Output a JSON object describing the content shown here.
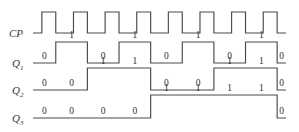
{
  "figure": {
    "kind": "timing-diagram",
    "stroke_color": "#4a4a4a",
    "text_color": "#2e2e2e",
    "background": "#ffffff"
  },
  "geometry": {
    "x_start": 33,
    "x_end": 286,
    "cycles": 8,
    "cp_baseline_y": 33,
    "cp_high_y": 12,
    "q1_baseline_y": 63,
    "q1_high_y": 42,
    "q2_baseline_y": 90,
    "q2_high_y": 68,
    "q3_baseline_y": 118,
    "q3_high_y": 95
  },
  "rows": [
    {
      "id": "cp",
      "label": "CP",
      "label_base": "CP",
      "label_sub": "",
      "label_x": 9,
      "label_y": 37,
      "show_values": false,
      "values": []
    },
    {
      "id": "q1",
      "label": "Q1",
      "label_base": "Q",
      "label_sub": "1",
      "label_x": 12,
      "label_y": 67,
      "show_values": true,
      "values": [
        "0",
        "1",
        "0",
        "1",
        "0",
        "1",
        "0",
        "1",
        "0"
      ]
    },
    {
      "id": "q2",
      "label": "Q2",
      "label_base": "Q",
      "label_sub": "2",
      "label_x": 12,
      "label_y": 94,
      "show_values": true,
      "values": [
        "0",
        "0",
        "1",
        "1",
        "0",
        "0",
        "1",
        "1",
        "0"
      ]
    },
    {
      "id": "q3",
      "label": "Q3",
      "label_base": "Q",
      "label_sub": "3",
      "label_x": 12,
      "label_y": 122,
      "show_values": true,
      "values": [
        "0",
        "0",
        "0",
        "0",
        "1",
        "1",
        "1",
        "1",
        "0"
      ]
    }
  ],
  "chart_data": {
    "type": "line",
    "title": "",
    "xlabel": "",
    "ylabel": "",
    "signals": [
      {
        "name": "CP",
        "waveform": [
          0,
          1,
          0,
          1,
          0,
          1,
          0,
          1,
          0,
          1,
          0,
          1,
          0,
          1,
          0,
          1,
          0
        ],
        "note": "clock, 8 pulses, starts low"
      },
      {
        "name": "Q1",
        "values": [
          0,
          1,
          0,
          1,
          0,
          1,
          0,
          1,
          0
        ],
        "note": "toggles on each clock falling edge"
      },
      {
        "name": "Q2",
        "values": [
          0,
          0,
          1,
          1,
          0,
          0,
          1,
          1,
          0
        ],
        "note": "toggles every two counts"
      },
      {
        "name": "Q3",
        "values": [
          0,
          0,
          0,
          0,
          1,
          1,
          1,
          1,
          0
        ],
        "note": "toggles every four counts"
      }
    ]
  }
}
